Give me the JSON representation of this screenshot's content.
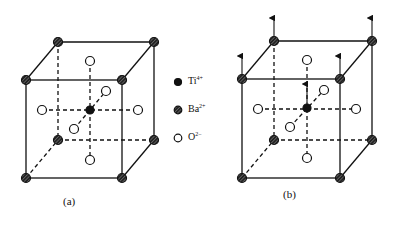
{
  "figure": {
    "panels": [
      {
        "id": "a",
        "caption": "(a)",
        "description": "BaTiO3 perovskite unit cell, centered Ti4+"
      },
      {
        "id": "b",
        "caption": "(b)",
        "description": "BaTiO3 unit cell with Ti4+ displaced upward (arrows show polarization)"
      }
    ],
    "legend": [
      {
        "symbol": "filled-black-circle",
        "label": "Ti",
        "charge": "4+"
      },
      {
        "symbol": "hatched-circle",
        "label": "Ba",
        "charge": "2+"
      },
      {
        "symbol": "open-circle",
        "label": "O",
        "charge": "2−"
      }
    ]
  },
  "colors": {
    "ink": "#111111",
    "background": "#ffffff"
  }
}
